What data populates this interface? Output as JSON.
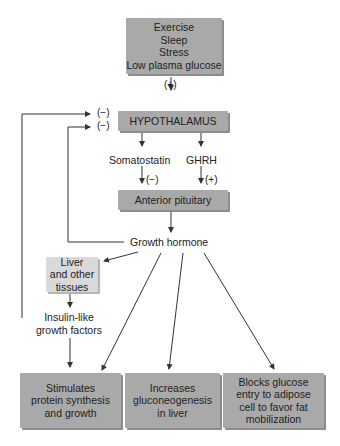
{
  "stimuli": [
    "Exercise",
    "Sleep",
    "Stress",
    "Low plasma glucose"
  ],
  "stimuli_sign": "(+)",
  "hypothalamus": "HYPOTHALAMUS",
  "feedback_signs": [
    "(−)",
    "(−)"
  ],
  "somatostatin": "Somatostatin",
  "ghrh": "GHRH",
  "somatostatin_sign": "(−)",
  "ghrh_sign": "(+)",
  "anterior_pituitary": "Anterior pituitary",
  "growth_hormone": "Growth hormone",
  "liver": [
    "Liver",
    "and other",
    "tissues"
  ],
  "igf": [
    "Insulin-like",
    "growth factors"
  ],
  "effects": [
    {
      "lines": [
        "Stimulates",
        "protein synthesis",
        "and growth"
      ]
    },
    {
      "lines": [
        "Increases",
        "gluconeogenesis",
        "in liver"
      ]
    },
    {
      "lines": [
        "Blocks glucose",
        "entry to adipose",
        "cell to favor fat",
        "mobilization"
      ]
    }
  ]
}
